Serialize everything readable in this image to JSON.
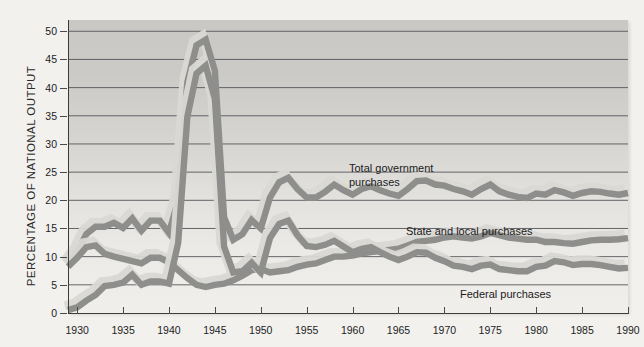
{
  "chart_data": {
    "type": "line",
    "title": "",
    "xlabel": "",
    "ylabel": "PERCENTAGE OF NATIONAL OUTPUT",
    "xlim": [
      1929,
      1990
    ],
    "ylim": [
      0,
      52
    ],
    "ytick_labels": [
      "0",
      "5",
      "10",
      "15",
      "20",
      "25",
      "30",
      "35",
      "40",
      "45",
      "50"
    ],
    "ytick_values": [
      0,
      5,
      10,
      15,
      20,
      25,
      30,
      35,
      40,
      45,
      50
    ],
    "xtick_labels": [
      "1930",
      "1935",
      "1940",
      "1945",
      "1950",
      "1955",
      "1960",
      "1965",
      "1970",
      "1975",
      "1980",
      "1985",
      "1990"
    ],
    "xtick_values": [
      1930,
      1935,
      1940,
      1945,
      1950,
      1955,
      1960,
      1965,
      1970,
      1975,
      1980,
      1985,
      1990
    ],
    "grid": true,
    "grid_axis": "y",
    "legend_position": "inline-annotations",
    "x": [
      1929,
      1930,
      1931,
      1932,
      1933,
      1934,
      1935,
      1936,
      1937,
      1938,
      1939,
      1940,
      1941,
      1942,
      1943,
      1944,
      1945,
      1946,
      1947,
      1948,
      1949,
      1950,
      1951,
      1952,
      1953,
      1954,
      1955,
      1956,
      1957,
      1958,
      1959,
      1960,
      1961,
      1962,
      1963,
      1964,
      1965,
      1966,
      1967,
      1968,
      1969,
      1970,
      1971,
      1972,
      1973,
      1974,
      1975,
      1976,
      1977,
      1978,
      1979,
      1980,
      1981,
      1982,
      1983,
      1984,
      1985,
      1986,
      1987,
      1988,
      1989,
      1990
    ],
    "series": [
      {
        "name": "Total government purchases",
        "label": "Total government\npurchases",
        "color": "#8c8c8c",
        "values": [
          8.6,
          10.7,
          14.0,
          15.3,
          15.3,
          16.0,
          15.1,
          16.8,
          14.6,
          16.4,
          16.4,
          14.2,
          20.0,
          41.0,
          47.5,
          48.5,
          43.0,
          17.0,
          13.0,
          14.0,
          16.5,
          15.0,
          20.5,
          23.2,
          24.0,
          22.0,
          20.5,
          20.5,
          21.5,
          22.8,
          21.8,
          21.0,
          22.0,
          22.5,
          21.8,
          21.2,
          20.8,
          22.0,
          23.4,
          23.5,
          22.8,
          22.6,
          22.0,
          21.6,
          21.0,
          22.0,
          22.8,
          21.6,
          21.0,
          20.6,
          20.4,
          21.2,
          21.0,
          21.8,
          21.4,
          20.8,
          21.3,
          21.6,
          21.5,
          21.2,
          21.0,
          21.3
        ]
      },
      {
        "name": "State and local purchases",
        "label": "State and local purchases",
        "color": "#8c8c8c",
        "values": [
          8.2,
          9.8,
          11.7,
          12.0,
          10.5,
          10.0,
          9.6,
          9.2,
          8.8,
          9.8,
          9.8,
          9.0,
          7.6,
          6.2,
          5.0,
          4.6,
          5.0,
          5.2,
          5.8,
          6.6,
          7.6,
          7.8,
          7.2,
          7.4,
          7.6,
          8.2,
          8.6,
          8.8,
          9.4,
          10.0,
          10.0,
          10.2,
          10.6,
          10.8,
          11.0,
          11.2,
          11.4,
          12.0,
          12.6,
          12.8,
          13.0,
          13.4,
          13.6,
          13.4,
          13.2,
          13.6,
          14.2,
          13.8,
          13.4,
          13.2,
          13.0,
          13.0,
          12.6,
          12.6,
          12.4,
          12.3,
          12.6,
          12.9,
          13.0,
          13.0,
          13.1,
          13.3
        ]
      },
      {
        "name": "Federal purchases",
        "label": "Federal purchases",
        "color": "#8c8c8c",
        "values": [
          0.5,
          1.0,
          2.2,
          3.2,
          4.8,
          5.0,
          5.4,
          6.8,
          5.0,
          5.6,
          5.6,
          5.2,
          12.4,
          34.8,
          42.5,
          43.9,
          38.0,
          11.8,
          7.2,
          7.4,
          8.9,
          7.2,
          13.3,
          15.8,
          16.4,
          13.8,
          11.9,
          11.7,
          12.1,
          12.8,
          11.8,
          10.8,
          11.4,
          11.7,
          10.8,
          10.0,
          9.4,
          10.0,
          10.8,
          10.7,
          9.8,
          9.2,
          8.4,
          8.2,
          7.8,
          8.4,
          8.6,
          7.8,
          7.6,
          7.4,
          7.4,
          8.2,
          8.4,
          9.2,
          9.0,
          8.5,
          8.7,
          8.7,
          8.5,
          8.2,
          7.9,
          8.0
        ]
      }
    ],
    "annotations": [
      {
        "id": "total-government-purchases-label",
        "text": "Total government\npurchases"
      },
      {
        "id": "state-and-local-purchases-label",
        "text": "State and local purchases"
      },
      {
        "id": "federal-purchases-label",
        "text": "Federal purchases"
      }
    ]
  },
  "axis": {
    "y_title": "PERCENTAGE OF NATIONAL OUTPUT"
  },
  "labels": {
    "total": "Total government\npurchases",
    "state_local": "State and local purchases",
    "federal": "Federal purchases"
  },
  "colors": {
    "band_dark": "#8e8e8c",
    "band_light": "#d9d8d4",
    "gridline": "#55565a",
    "axis": "#3b3b3b",
    "page_bg": "#f2f1ee",
    "plot_bg_top": "#c9c8c5",
    "plot_bg_bottom": "#f1efec",
    "text": "#1d1d1d"
  }
}
